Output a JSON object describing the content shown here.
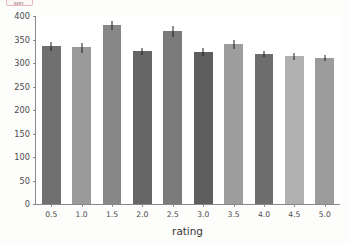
{
  "corner_badge": {
    "label": "MPL"
  },
  "chart_data": {
    "type": "bar",
    "title": "",
    "subtitle": "",
    "xlabel": "rating",
    "ylabel": "",
    "categories": [
      "0.5",
      "1.0",
      "1.5",
      "2.0",
      "2.5",
      "3.0",
      "3.5",
      "4.0",
      "4.5",
      "5.0"
    ],
    "values": [
      335,
      332,
      380,
      324,
      367,
      323,
      339,
      319,
      314,
      310
    ],
    "errors": [
      9,
      11,
      10,
      8,
      11,
      9,
      10,
      7,
      7,
      6
    ],
    "bar_colors": [
      "#707070",
      "#9a9a9a",
      "#878787",
      "#666666",
      "#7b7b7b",
      "#5e5e5e",
      "#9d9d9d",
      "#6d6d6d",
      "#b0b0b0",
      "#9b9b9b"
    ],
    "error_color": "#1d1d1d",
    "ylim": [
      0,
      400
    ],
    "yticks": [
      0,
      50,
      100,
      150,
      200,
      250,
      300,
      350,
      400
    ],
    "ytick_labels": [
      "0",
      "50",
      "100",
      "150",
      "200",
      "250",
      "300",
      "350",
      "400"
    ],
    "xtick_labels": [
      "0.5",
      "1.0",
      "1.5",
      "2.0",
      "2.5",
      "3.0",
      "3.5",
      "4.0",
      "4.5",
      "5.0"
    ],
    "grid": false,
    "legend": null,
    "legend_position": "none",
    "axis_color": "#8a8a8a",
    "background": "#ffffff"
  }
}
